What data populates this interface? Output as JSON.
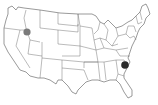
{
  "map": {
    "type": "us-states-outline",
    "background": "#ffffff",
    "outline_color": "#555555",
    "markers": [
      {
        "name": "idaho-marker",
        "state": "Idaho",
        "x": 27,
        "y": 32,
        "r": 3.6,
        "color": "#7a7a7a"
      },
      {
        "name": "south-carolina-marker",
        "state": "South Carolina",
        "x": 125,
        "y": 65,
        "r": 3.8,
        "color": "#2a2a2a"
      }
    ]
  }
}
